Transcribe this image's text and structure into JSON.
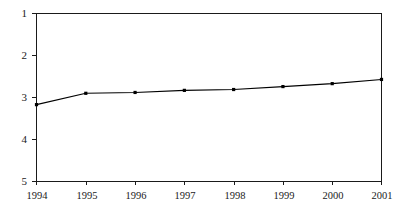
{
  "chart_data": {
    "type": "line",
    "title": "",
    "subtitle": "",
    "xlabel": "",
    "ylabel": "",
    "categories": [
      "1994",
      "1995",
      "1996",
      "1997",
      "1998",
      "1999",
      "2000",
      "2001"
    ],
    "values": [
      3.17,
      2.9,
      2.88,
      2.83,
      2.81,
      2.74,
      2.67,
      2.57
    ],
    "series": [
      {
        "name": "series-1",
        "values": [
          3.17,
          2.9,
          2.88,
          2.83,
          2.81,
          2.74,
          2.67,
          2.57
        ]
      }
    ],
    "ylim": [
      1,
      5
    ],
    "y_inverted": true,
    "yticks": [
      1,
      2,
      3,
      4,
      5
    ],
    "ytick_labels": [
      "1",
      "2",
      "3",
      "4",
      "5"
    ],
    "xtick_labels": [
      "1994",
      "1995",
      "1996",
      "1997",
      "1998",
      "1999",
      "2000",
      "2001"
    ],
    "grid": false,
    "legend": false,
    "legend_position": "none",
    "line_color": "#000000",
    "marker_color": "#000000",
    "marker_shape": "square",
    "axis_color": "#1a1a1a",
    "background_color": "#ffffff"
  },
  "axes": {
    "y": {
      "ticks": [
        {
          "label": "1",
          "value": 1
        },
        {
          "label": "2",
          "value": 2
        },
        {
          "label": "3",
          "value": 3
        },
        {
          "label": "4",
          "value": 4
        },
        {
          "label": "5",
          "value": 5
        }
      ]
    },
    "x": {
      "ticks": [
        {
          "label": "1994"
        },
        {
          "label": "1995"
        },
        {
          "label": "1996"
        },
        {
          "label": "1997"
        },
        {
          "label": "1998"
        },
        {
          "label": "1999"
        },
        {
          "label": "2000"
        },
        {
          "label": "2001"
        }
      ]
    }
  }
}
